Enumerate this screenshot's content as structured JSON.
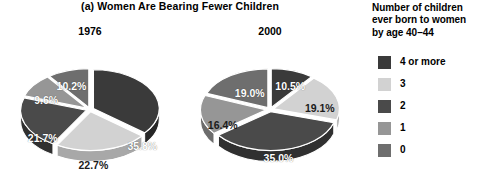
{
  "figure": {
    "title": "(a) Women Are Bearing Fewer Children"
  },
  "legend": {
    "title": "Number of children\never born to women\nby age 40–44",
    "items": [
      {
        "label": "4 or more",
        "color": "#3a3a3a",
        "key": "4plus"
      },
      {
        "label": "3",
        "color": "#d2d2d2",
        "key": "3"
      },
      {
        "label": "2",
        "color": "#4a4a4a",
        "key": "2"
      },
      {
        "label": "1",
        "color": "#969696",
        "key": "1"
      },
      {
        "label": "0",
        "color": "#6e6e6e",
        "key": "0"
      }
    ]
  },
  "chart_data": {
    "type": "pie",
    "title": "(a) Women Are Bearing Fewer Children",
    "legend_title": "Number of children ever born to women by age 40-44",
    "legend_position": "right",
    "categories": [
      "4 or more",
      "3",
      "2",
      "1",
      "0"
    ],
    "colors": [
      "#3a3a3a",
      "#d2d2d2",
      "#4a4a4a",
      "#969696",
      "#6e6e6e"
    ],
    "charts": [
      {
        "name": "1976",
        "labels": [
          "35.8%",
          "22.7%",
          "21.7%",
          "9.6%",
          "10.2%"
        ],
        "values": [
          35.8,
          22.7,
          21.7,
          9.6,
          10.2
        ],
        "categories": [
          "4 or more",
          "3",
          "2",
          "1",
          "0"
        ],
        "colors": [
          "#3a3a3a",
          "#d2d2d2",
          "#4a4a4a",
          "#969696",
          "#6e6e6e"
        ]
      },
      {
        "name": "2000",
        "labels": [
          "10.5%",
          "19.1%",
          "35.0%",
          "16.4%",
          "19.0%"
        ],
        "values": [
          10.5,
          19.1,
          35.0,
          16.4,
          19.0
        ],
        "categories": [
          "4 or more",
          "3",
          "2",
          "1",
          "0"
        ],
        "colors": [
          "#3a3a3a",
          "#d2d2d2",
          "#4a4a4a",
          "#969696",
          "#6e6e6e"
        ]
      }
    ]
  },
  "pies": [
    {
      "year": "1976",
      "slices": [
        {
          "label": "35.8%",
          "value": 35.8,
          "category": "4 or more",
          "color": "#3a3a3a",
          "side": "#262626",
          "lx": 62,
          "ly": 43,
          "text": "light"
        },
        {
          "label": "22.7%",
          "value": 22.7,
          "category": "3",
          "color": "#d2d2d2",
          "side": "#a8a8a8",
          "lx": 4,
          "ly": 66,
          "text": "dark"
        },
        {
          "label": "21.7%",
          "value": 21.7,
          "category": "2",
          "color": "#4a4a4a",
          "side": "#303030",
          "lx": -56,
          "ly": 34,
          "text": "light"
        },
        {
          "label": "9.6%",
          "value": 9.6,
          "category": "1",
          "color": "#969696",
          "side": "#6c6c6c",
          "lx": -52,
          "ly": -11,
          "text": "light"
        },
        {
          "label": "10.2%",
          "value": 10.2,
          "category": "0",
          "color": "#6e6e6e",
          "side": "#4c4c4c",
          "lx": -22,
          "ly": -28,
          "text": "light"
        }
      ]
    },
    {
      "year": "2000",
      "slices": [
        {
          "label": "10.5%",
          "value": 10.5,
          "category": "4 or more",
          "color": "#3a3a3a",
          "side": "#262626",
          "lx": 24,
          "ly": -28,
          "text": "light"
        },
        {
          "label": "19.1%",
          "value": 19.1,
          "category": "3",
          "color": "#d2d2d2",
          "side": "#a8a8a8",
          "lx": 59,
          "ly": -2,
          "text": "dark"
        },
        {
          "label": "35.0%",
          "value": 35.0,
          "category": "2",
          "color": "#4a4a4a",
          "side": "#303030",
          "lx": 10,
          "ly": 58,
          "text": "light"
        },
        {
          "label": "16.4%",
          "value": 16.4,
          "category": "1",
          "color": "#969696",
          "side": "#6c6c6c",
          "lx": -56,
          "ly": 18,
          "text": "dark"
        },
        {
          "label": "19.0%",
          "value": 19.0,
          "category": "0",
          "color": "#6e6e6e",
          "side": "#4c4c4c",
          "lx": -24,
          "ly": -20,
          "text": "light"
        }
      ]
    }
  ]
}
